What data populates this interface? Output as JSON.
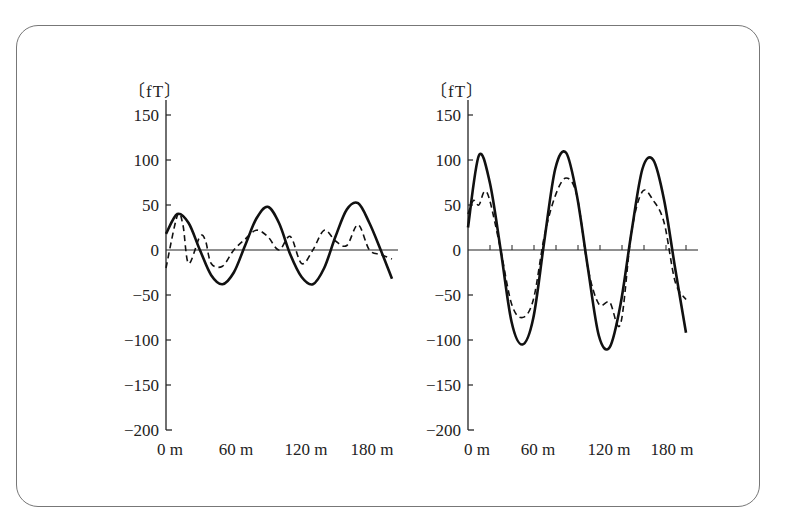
{
  "chart_data": [
    {
      "type": "line",
      "title": "",
      "ylabel": "〔fT〕",
      "xlabel": "",
      "ylim": [
        -200,
        160
      ],
      "xlim": [
        0,
        200
      ],
      "yticks": [
        150,
        100,
        50,
        0,
        -50,
        -100,
        -150,
        -200
      ],
      "ytick_labels": [
        "150",
        "100",
        "50",
        "0",
        "−50",
        "−100",
        "−150",
        "−200"
      ],
      "xtick_labels": [
        "0 m",
        "60 m",
        "120 m",
        "180 m"
      ],
      "xticks": [
        0,
        60,
        120,
        180
      ],
      "grid": false,
      "legend": null,
      "series": [
        {
          "name": "solid",
          "style": "solid",
          "x": [
            0,
            10,
            20,
            30,
            40,
            50,
            60,
            70,
            80,
            90,
            100,
            110,
            120,
            130,
            140,
            150,
            160,
            170,
            180,
            190,
            200
          ],
          "y": [
            18,
            40,
            30,
            0,
            -28,
            -38,
            -25,
            5,
            35,
            48,
            30,
            -5,
            -30,
            -38,
            -20,
            15,
            45,
            52,
            30,
            0,
            -32
          ]
        },
        {
          "name": "dashed",
          "style": "dashed",
          "x": [
            0,
            10,
            15,
            20,
            30,
            35,
            40,
            50,
            60,
            70,
            80,
            90,
            100,
            110,
            120,
            130,
            140,
            150,
            160,
            170,
            180,
            190,
            200
          ],
          "y": [
            -20,
            38,
            28,
            -15,
            15,
            10,
            -15,
            -18,
            0,
            12,
            22,
            15,
            0,
            15,
            -15,
            0,
            22,
            10,
            5,
            28,
            0,
            -5,
            -10
          ]
        }
      ]
    },
    {
      "type": "line",
      "title": "",
      "ylabel": "〔fT〕",
      "xlabel": "",
      "ylim": [
        -200,
        160
      ],
      "xlim": [
        0,
        200
      ],
      "yticks": [
        150,
        100,
        50,
        0,
        -50,
        -100,
        -150,
        -200
      ],
      "ytick_labels": [
        "150",
        "100",
        "50",
        "0",
        "−50",
        "−100",
        "−150",
        "−200"
      ],
      "xtick_labels": [
        "0 m",
        "60 m",
        "120 m",
        "180 m"
      ],
      "xticks": [
        0,
        60,
        120,
        180
      ],
      "grid": false,
      "legend": null,
      "series": [
        {
          "name": "solid",
          "style": "solid",
          "x": [
            0,
            10,
            20,
            30,
            40,
            50,
            60,
            70,
            80,
            90,
            100,
            110,
            120,
            130,
            140,
            150,
            160,
            170,
            180,
            190,
            200
          ],
          "y": [
            25,
            105,
            75,
            0,
            -80,
            -105,
            -75,
            10,
            90,
            108,
            60,
            -20,
            -95,
            -108,
            -60,
            20,
            90,
            100,
            55,
            -20,
            -92
          ]
        },
        {
          "name": "dashed",
          "style": "dashed",
          "x": [
            0,
            5,
            10,
            15,
            20,
            30,
            40,
            50,
            60,
            70,
            80,
            90,
            100,
            110,
            120,
            130,
            140,
            150,
            160,
            170,
            180,
            190,
            200
          ],
          "y": [
            40,
            55,
            50,
            65,
            55,
            0,
            -60,
            -75,
            -55,
            15,
            60,
            80,
            60,
            -20,
            -60,
            -58,
            -82,
            20,
            65,
            55,
            30,
            -35,
            -55
          ]
        }
      ]
    }
  ]
}
